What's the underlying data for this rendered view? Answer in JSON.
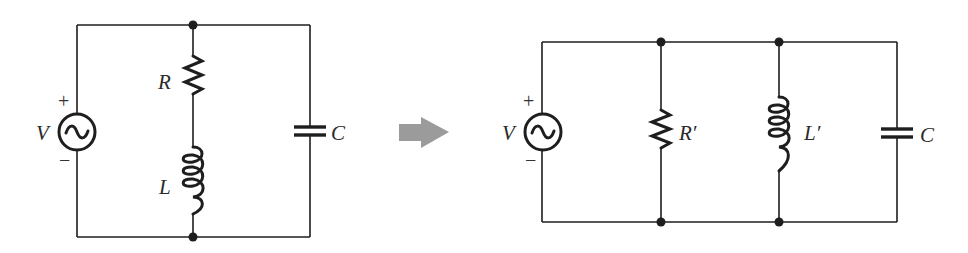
{
  "figure": {
    "arrow_color": "#9b9b9b",
    "line_color": "#1e1e1e"
  },
  "left_circuit": {
    "source": {
      "label": "V",
      "plus": "+",
      "minus": "−",
      "icon": "ac-source-icon"
    },
    "resistor": {
      "label": "R"
    },
    "inductor": {
      "label": "L"
    },
    "capacitor": {
      "label": "C"
    }
  },
  "transform_arrow": {
    "icon": "right-arrow-icon"
  },
  "right_circuit": {
    "source": {
      "label": "V",
      "plus": "+",
      "minus": "−",
      "icon": "ac-source-icon"
    },
    "resistor": {
      "label": "R′"
    },
    "inductor": {
      "label": "L′"
    },
    "capacitor": {
      "label": "C"
    }
  }
}
